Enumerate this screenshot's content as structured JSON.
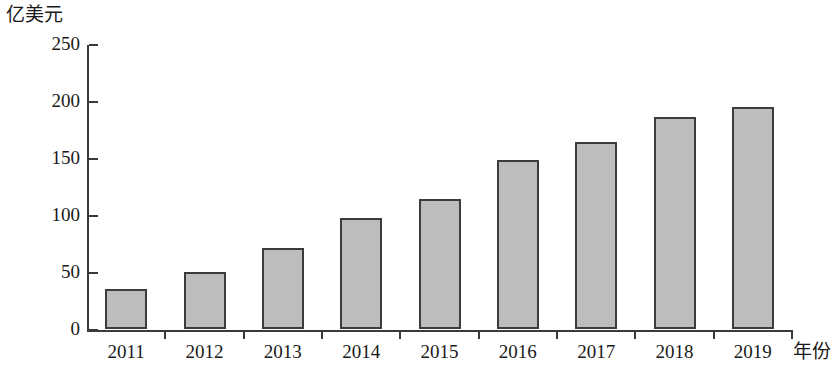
{
  "chart_data": {
    "type": "bar",
    "title": "",
    "subtitle": "",
    "xlabel": "年份",
    "ylabel": "亿美元",
    "categories": [
      "2011",
      "2012",
      "2013",
      "2014",
      "2015",
      "2016",
      "2017",
      "2018",
      "2019"
    ],
    "values": [
      35,
      50,
      71,
      97,
      114,
      148,
      164,
      186,
      195
    ],
    "series": [
      {
        "name": "",
        "values": [
          35,
          50,
          71,
          97,
          114,
          148,
          164,
          186,
          195
        ]
      }
    ],
    "ylim": [
      0,
      250
    ],
    "y_ticks": [
      0,
      50,
      100,
      150,
      200,
      250
    ],
    "y_tick_labels": [
      "0",
      "50",
      "100",
      "150",
      "200",
      "250"
    ],
    "grid": false,
    "legend": false,
    "legend_position": "none",
    "bar_fill_color": "#bdbdbd",
    "bar_edge_color": "#3c3c3c",
    "axis_color": "#3a3a3a",
    "text_color": "#1a1a1a",
    "background_color": "#ffffff"
  },
  "axes": {
    "y_unit_caption": "亿美元",
    "x_axis_caption": "年份"
  }
}
